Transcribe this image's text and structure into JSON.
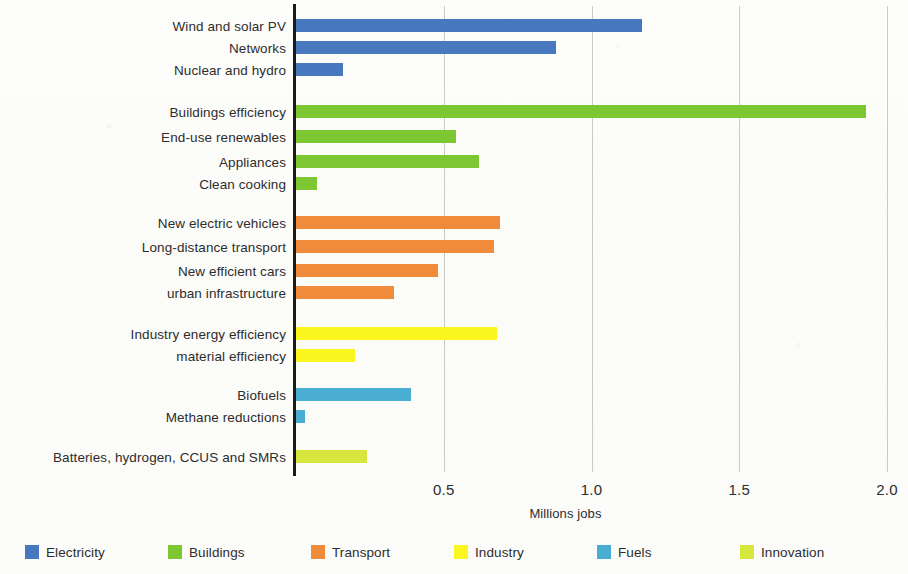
{
  "chart_data": {
    "type": "bar",
    "orientation": "horizontal",
    "title": "",
    "xlabel": "Millions jobs",
    "ylabel": "",
    "xlim": [
      0,
      2.0
    ],
    "xticks": [
      "0.5",
      "1.0",
      "1.5",
      "2.0"
    ],
    "xtick_values": [
      0.5,
      1.0,
      1.5,
      2.0
    ],
    "grid": "vertical-dashed",
    "legend_position": "bottom",
    "categories": [
      "Wind and solar PV",
      "Networks",
      "Nuclear and hydro",
      "Buildings efficiency",
      "End-use renewables",
      "Appliances",
      "Clean cooking",
      "New electric vehicles",
      "Long-distance transport",
      "New efficient cars",
      "urban infrastructure",
      "Industry energy efficiency",
      "material efficiency",
      "Biofuels",
      "Methane reductions",
      "Batteries, hydrogen, CCUS and SMRs"
    ],
    "values": [
      1.17,
      0.88,
      0.16,
      1.93,
      0.54,
      0.62,
      0.07,
      0.69,
      0.67,
      0.48,
      0.33,
      0.68,
      0.2,
      0.39,
      0.03,
      0.24
    ],
    "groups": [
      "Electricity",
      "Electricity",
      "Electricity",
      "Buildings",
      "Buildings",
      "Buildings",
      "Buildings",
      "Transport",
      "Transport",
      "Transport",
      "Transport",
      "Industry",
      "Industry",
      "Fuels",
      "Fuels",
      "Innovation"
    ],
    "series": [
      {
        "name": "Electricity",
        "color": "#4878be",
        "points": [
          {
            "label": "Wind and solar PV",
            "value": 1.17
          },
          {
            "label": "Networks",
            "value": 0.88
          },
          {
            "label": "Nuclear and hydro",
            "value": 0.16
          }
        ]
      },
      {
        "name": "Buildings",
        "color": "#7dc832",
        "points": [
          {
            "label": "Buildings efficiency",
            "value": 1.93
          },
          {
            "label": "End-use renewables",
            "value": 0.54
          },
          {
            "label": "Appliances",
            "value": 0.62
          },
          {
            "label": "Clean cooking",
            "value": 0.07
          }
        ]
      },
      {
        "name": "Transport",
        "color": "#f08b3c",
        "points": [
          {
            "label": "New electric vehicles",
            "value": 0.69
          },
          {
            "label": "Long-distance transport",
            "value": 0.67
          },
          {
            "label": "New efficient cars",
            "value": 0.48
          },
          {
            "label": "urban infrastructure",
            "value": 0.33
          }
        ]
      },
      {
        "name": "Industry",
        "color": "#fbf61e",
        "points": [
          {
            "label": "Industry energy efficiency",
            "value": 0.68
          },
          {
            "label": "material efficiency",
            "value": 0.2
          }
        ]
      },
      {
        "name": "Fuels",
        "color": "#4aaed2",
        "points": [
          {
            "label": "Biofuels",
            "value": 0.39
          },
          {
            "label": "Methane reductions",
            "value": 0.03
          }
        ]
      },
      {
        "name": "Innovation",
        "color": "#d7e63c",
        "points": [
          {
            "label": "Batteries, hydrogen, CCUS and SMRs",
            "value": 0.24
          }
        ]
      }
    ]
  },
  "axis": {
    "title": "Millions jobs",
    "ticks": [
      {
        "label": "0.5",
        "value": 0.5
      },
      {
        "label": "1.0",
        "value": 1.0
      },
      {
        "label": "1.5",
        "value": 1.5
      },
      {
        "label": "2.0",
        "value": 2.0
      }
    ]
  },
  "legend": {
    "items": [
      {
        "label": "Electricity",
        "color": "#4878be"
      },
      {
        "label": "Buildings",
        "color": "#7dc832"
      },
      {
        "label": "Transport",
        "color": "#f08b3c"
      },
      {
        "label": "Industry",
        "color": "#fbf61e"
      },
      {
        "label": "Fuels",
        "color": "#4aaed2"
      },
      {
        "label": "Innovation",
        "color": "#d7e63c"
      }
    ]
  },
  "rows": [
    {
      "label": "Wind and solar PV",
      "value": 1.17,
      "color": "#4878be",
      "y": 18
    },
    {
      "label": "Networks",
      "value": 0.88,
      "color": "#4878be",
      "y": 40
    },
    {
      "label": "Nuclear and hydro",
      "value": 0.16,
      "color": "#4878be",
      "y": 62
    },
    {
      "label": "Buildings efficiency",
      "value": 1.93,
      "color": "#7dc832",
      "y": 104
    },
    {
      "label": "End-use renewables",
      "value": 0.54,
      "color": "#7dc832",
      "y": 129
    },
    {
      "label": "Appliances",
      "value": 0.62,
      "color": "#7dc832",
      "y": 154
    },
    {
      "label": "Clean cooking",
      "value": 0.07,
      "color": "#7dc832",
      "y": 176
    },
    {
      "label": "New electric vehicles",
      "value": 0.69,
      "color": "#f08b3c",
      "y": 215
    },
    {
      "label": "Long-distance transport",
      "value": 0.67,
      "color": "#f08b3c",
      "y": 239
    },
    {
      "label": "New efficient cars",
      "value": 0.48,
      "color": "#f08b3c",
      "y": 263
    },
    {
      "label": "urban infrastructure",
      "value": 0.33,
      "color": "#f08b3c",
      "y": 285
    },
    {
      "label": "Industry energy efficiency",
      "value": 0.68,
      "color": "#fbf61e",
      "y": 326
    },
    {
      "label": "material efficiency",
      "value": 0.2,
      "color": "#fbf61e",
      "y": 348
    },
    {
      "label": "Biofuels",
      "value": 0.39,
      "color": "#4aaed2",
      "y": 387
    },
    {
      "label": "Methane reductions",
      "value": 0.03,
      "color": "#4aaed2",
      "y": 409
    },
    {
      "label": "Batteries, hydrogen, CCUS and SMRs",
      "value": 0.24,
      "color": "#d7e63c",
      "y": 449
    }
  ]
}
